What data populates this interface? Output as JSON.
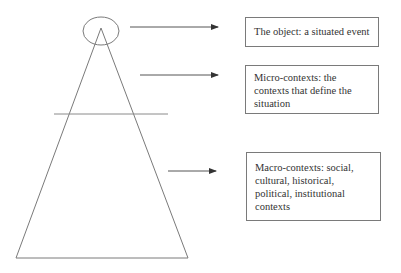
{
  "diagram": {
    "shapes": {
      "cone_triangle": {
        "apex": [
          101,
          28
        ],
        "base_left": [
          16,
          258
        ],
        "base_right": [
          188,
          258
        ]
      },
      "top_ellipse": {
        "cx": 101,
        "cy": 31,
        "rx": 18,
        "ry": 14
      },
      "divider_line": {
        "x1": 54,
        "x2": 168,
        "y": 114
      },
      "stroke_color": "#7a7a7a"
    },
    "arrows": [
      {
        "x1": 130,
        "x2": 218,
        "y": 27,
        "target": "object"
      },
      {
        "x1": 140,
        "x2": 218,
        "y": 75,
        "target": "micro"
      },
      {
        "x1": 168,
        "x2": 216,
        "y": 171,
        "target": "macro"
      }
    ],
    "boxes": {
      "object": {
        "lines": [
          "The object: a situated event"
        ]
      },
      "micro": {
        "lines": [
          "Micro-contexts: the",
          "contexts that define the",
          "situation"
        ]
      },
      "macro": {
        "lines": [
          "Macro-contexts: social,",
          "cultural, historical,",
          "political, institutional",
          "contexts"
        ]
      }
    }
  }
}
